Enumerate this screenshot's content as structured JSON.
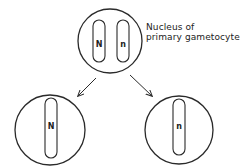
{
  "diagram": {
    "type": "meiosis-reduction",
    "colors": {
      "stroke": "#2a2a2a",
      "background": "#ffffff"
    },
    "parent": {
      "label_line1": "Nucleus of",
      "label_line2": "primary gametocyte",
      "chromosomes": [
        {
          "letter": "N"
        },
        {
          "letter": "n"
        }
      ]
    },
    "daughters": [
      {
        "position": "left",
        "chromosome": {
          "letter": "N"
        }
      },
      {
        "position": "right",
        "chromosome": {
          "letter": "n"
        }
      }
    ],
    "arrows": [
      {
        "from": "parent",
        "to": "left-daughter",
        "icon": "arrow-down-left-icon"
      },
      {
        "from": "parent",
        "to": "right-daughter",
        "icon": "arrow-down-right-icon"
      }
    ]
  }
}
